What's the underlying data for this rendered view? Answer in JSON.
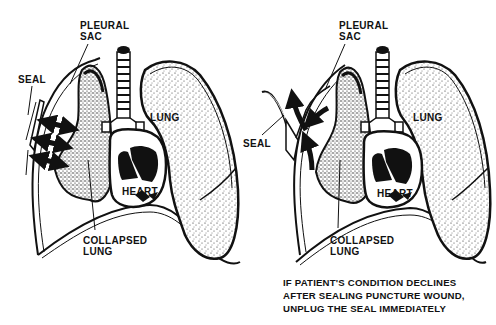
{
  "figure": {
    "type": "medical-illustration",
    "colors": {
      "ink": "#111111",
      "background": "#ffffff",
      "stipple": "#222222"
    }
  },
  "left_panel": {
    "labels": {
      "pleural_sac": "PLEURAL\nSAC",
      "seal": "SEAL",
      "lung": "LUNG",
      "heart": "HEART",
      "collapsed_lung": "COLLAPSED\nLUNG"
    },
    "arrows": {
      "count": 3,
      "direction": "double-headed-horizontal"
    }
  },
  "right_panel": {
    "labels": {
      "pleural_sac": "PLEURAL\nSAC",
      "seal": "SEAL",
      "lung": "LUNG",
      "heart": "HEART",
      "collapsed_lung": "COLLAPSED\nLUNG"
    },
    "arrows": {
      "count": 3,
      "direction": "air-escaping-outward"
    }
  },
  "caption": {
    "lines": [
      "IF PATIENT'S CONDITION DECLINES",
      "AFTER SEALING PUNCTURE WOUND,",
      "UNPLUG THE SEAL IMMEDIATELY"
    ]
  }
}
